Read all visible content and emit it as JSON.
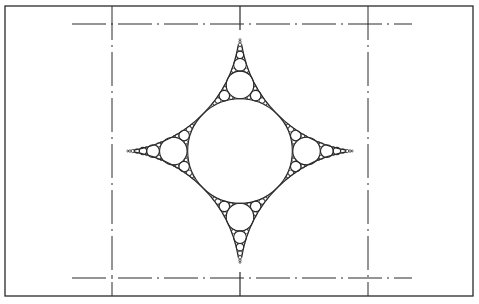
{
  "figure": {
    "width": 479,
    "height": 304,
    "background": "#ffffff",
    "stroke_color": "#2a2a2a",
    "frame": {
      "x1": 5,
      "y1": 6,
      "x2": 473,
      "y2": 296
    },
    "outer_circles": {
      "radius": 128,
      "centers": [
        [
          112,
          24
        ],
        [
          368,
          24
        ],
        [
          112,
          278
        ],
        [
          368,
          278
        ]
      ]
    },
    "center": [
      240,
      151
    ],
    "packing_depth": 7,
    "min_radius": 0.9,
    "centerlines": {
      "vertical_x": [
        112,
        368
      ],
      "vertical_y_range": [
        6,
        296
      ],
      "horizontal_y": [
        24,
        278
      ],
      "horizontal_x_range": [
        72,
        412
      ]
    }
  }
}
